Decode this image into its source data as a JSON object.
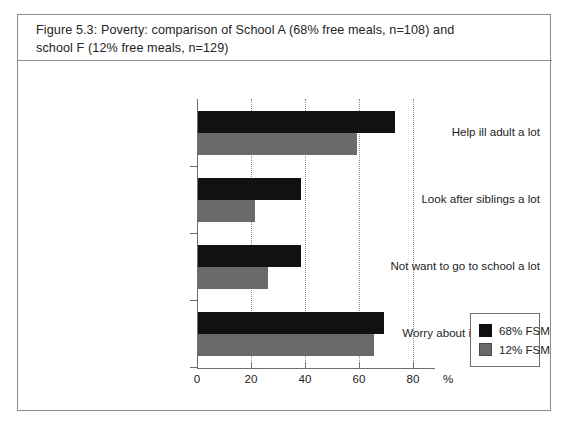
{
  "figure": {
    "caption_line_1": "Figure 5.3:  Poverty: comparison of School A (68% free meals, n=108) and",
    "caption_line_2": "school F (12% free meals, n=129)"
  },
  "chart_data": {
    "type": "bar",
    "orientation": "horizontal",
    "title": "Figure 5.3:  Poverty: comparison of School A (68% free meals, n=108) and school F (12% free meals, n=129)",
    "xlabel": "%",
    "ylabel": "",
    "xlim": [
      0,
      80
    ],
    "xticks": [
      0,
      20,
      40,
      60,
      80
    ],
    "xtick_labels": [
      "0",
      "20",
      "40",
      "60",
      "80"
    ],
    "grid": "vertical-dotted",
    "legend_position": "right-lower",
    "categories": [
      "Help ill adult a lot",
      "Look after siblings a lot",
      "Not want to go to school a lot",
      "Worry about ill person a lot"
    ],
    "series": [
      {
        "name": "68% FSM",
        "color": "#111111",
        "values": [
          73,
          38,
          38,
          69
        ]
      },
      {
        "name": "12% FSM",
        "color": "#6a6a6a",
        "values": [
          59,
          21,
          26,
          65
        ]
      }
    ]
  },
  "legend": {
    "entries": [
      {
        "label": "68% FSM",
        "color": "#111111"
      },
      {
        "label": "12% FSM",
        "color": "#6a6a6a"
      }
    ]
  },
  "axis": {
    "unit_label": "%"
  }
}
